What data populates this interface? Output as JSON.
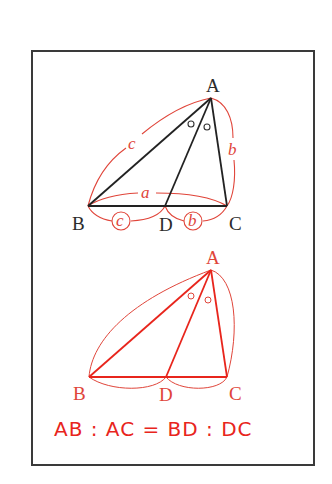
{
  "colors": {
    "frame": "#3a3a3a",
    "black_line": "#222222",
    "red_line": "#e8251c",
    "red_arc": "#e0453a"
  },
  "top_figure": {
    "vertices": {
      "A": {
        "label": "A",
        "x": 211,
        "y": 98
      },
      "B": {
        "label": "B",
        "x": 88,
        "y": 206
      },
      "C": {
        "label": "C",
        "x": 227,
        "y": 206
      },
      "D": {
        "label": "D",
        "x": 165,
        "y": 206
      }
    },
    "side_labels": {
      "c": "c",
      "b": "b",
      "a": "a"
    },
    "segment_labels": {
      "BD": "c",
      "DC": "b"
    },
    "angle_marks": [
      "○",
      "○"
    ]
  },
  "bottom_figure": {
    "vertices": {
      "A": {
        "label": "A",
        "x": 211,
        "y": 270
      },
      "B": {
        "label": "B",
        "x": 89,
        "y": 377
      },
      "C": {
        "label": "C",
        "x": 227,
        "y": 377
      },
      "D": {
        "label": "D",
        "x": 166,
        "y": 377
      }
    },
    "angle_marks": [
      "○",
      "○"
    ]
  },
  "formula": {
    "text": "AB : AC = BD : DC",
    "parts": [
      "AB",
      ":",
      "AC",
      "=",
      "BD",
      ":",
      "DC"
    ]
  }
}
